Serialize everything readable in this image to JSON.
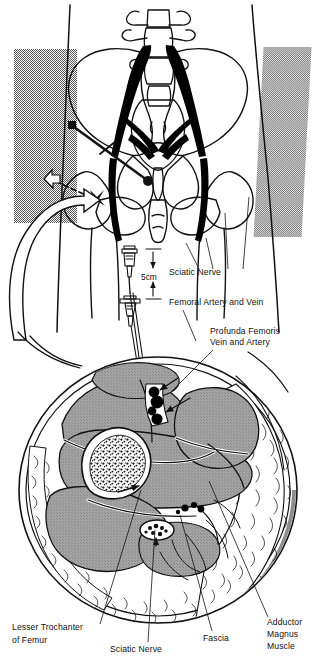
{
  "figure": {
    "subtitle": "Pelvic surface landmarks and mid-thigh cross section",
    "background_color": "#ffffff",
    "ink_color": "#111111",
    "muscle_fill": "#9a9a9a",
    "shadow_fill": "#8d8d8d",
    "bone_fill": "#ffffff",
    "fat_fill": "#ffffff",
    "nerve_fill": "#000000",
    "vessel_fill": "#000000",
    "halftone_color": "#8b8b8b"
  },
  "panels": {
    "top": {
      "name": "pelvis-anterior-view",
      "description": "Anterior pelvis with lumbar vertebrae, sacrum, ilium, femoral heads and sciatic nerve shown in solid black"
    },
    "middle": {
      "name": "needle-depth-diagram",
      "description": "Two needle hubs illustrating a 5 cm advance of the block needle"
    },
    "bottom": {
      "name": "thigh-cross-section",
      "description": "Axial cross section of the proximal thigh at the level of the lesser trochanter"
    }
  },
  "measurement": {
    "value": "5cm",
    "name": "needle-advance-distance"
  },
  "labels": [
    {
      "id": "sciatic-nerve-upper",
      "text": "Sciatic Nerve",
      "x": 169,
      "y": 275,
      "anchor": "start",
      "leaders": [
        [
          199,
          269,
          186,
          243
        ],
        [
          213,
          269,
          206,
          238
        ],
        [
          228,
          269,
          225,
          213
        ],
        [
          243,
          269,
          249,
          197
        ]
      ]
    },
    {
      "id": "femoral-artery-and-vein",
      "text": "Femoral Artery and Vein",
      "x": 169,
      "y": 305,
      "anchor": "start",
      "leaders": [
        [
          183,
          310,
          196,
          341
        ]
      ]
    },
    {
      "id": "profunda-femoris-line1",
      "text": "Profunda Femoris",
      "x": 210,
      "y": 334,
      "anchor": "start",
      "leaders": []
    },
    {
      "id": "profunda-femoris-line2",
      "text": "Vein and Artery",
      "x": 210,
      "y": 345,
      "anchor": "start",
      "leaders": [
        [
          213,
          350,
          172,
          391
        ]
      ]
    },
    {
      "id": "lesser-trochanter-line1",
      "text": "Lesser Trochanter",
      "x": 12,
      "y": 630,
      "anchor": "start",
      "leaders": []
    },
    {
      "id": "lesser-trochanter-line2",
      "text": "of Femur",
      "x": 12,
      "y": 643,
      "anchor": "start",
      "leaders": [
        [
          100,
          624,
          141,
          490
        ]
      ]
    },
    {
      "id": "sciatic-nerve-lower",
      "text": "Sciatic Nerve",
      "x": 110,
      "y": 652,
      "anchor": "start",
      "leaders": [
        [
          148,
          642,
          155,
          530
        ]
      ]
    },
    {
      "id": "fascia",
      "text": "Fascia",
      "x": 203,
      "y": 641,
      "anchor": "start",
      "leaders": [
        [
          212,
          631,
          180,
          515
        ]
      ]
    },
    {
      "id": "adductor-magnus-line1",
      "text": "Adductor",
      "x": 267,
      "y": 625,
      "anchor": "start",
      "leaders": []
    },
    {
      "id": "adductor-magnus-line2",
      "text": "Magnus",
      "x": 267,
      "y": 637,
      "anchor": "start",
      "leaders": []
    },
    {
      "id": "adductor-magnus-line3",
      "text": "Muscle",
      "x": 267,
      "y": 649,
      "anchor": "start",
      "leaders": [
        [
          268,
          617,
          209,
          481
        ]
      ]
    }
  ],
  "anatomy_terms": [
    "Sciatic Nerve",
    "Femoral Artery and Vein",
    "Profunda Femoris Vein and Artery",
    "Lesser Trochanter of Femur",
    "Fascia",
    "Adductor Magnus Muscle"
  ]
}
